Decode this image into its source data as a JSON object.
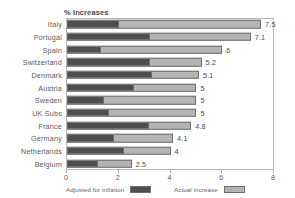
{
  "chart_data": {
    "type": "bar",
    "orientation": "horizontal",
    "stacked": true,
    "title": "% Increases",
    "xlabel": "",
    "ylabel": "",
    "xlim": [
      0,
      8
    ],
    "xticks": [
      "0",
      "2",
      "4",
      "6",
      "8"
    ],
    "grid": false,
    "legend_position": "bottom",
    "categories": [
      "Italy",
      "Portugal",
      "Spain",
      "Switzerland",
      "Denmark",
      "Austria",
      "Sweden",
      "UK Subs",
      "France",
      "Germany",
      "Netherlands",
      "Belgium"
    ],
    "series": [
      {
        "name": "Adjusted for inflation",
        "color": "#4e4e4e",
        "values": [
          2.0,
          3.2,
          1.3,
          3.2,
          3.3,
          2.6,
          1.4,
          1.6,
          3.2,
          1.8,
          2.2,
          1.2
        ]
      },
      {
        "name": "Actual increase",
        "color": "#b4b4b4",
        "values": [
          7.5,
          7.1,
          6,
          5.2,
          5.1,
          5,
          5,
          5,
          4.8,
          4.1,
          4,
          2.5
        ]
      }
    ],
    "data_labels": [
      "7.5",
      "7.1",
      "6",
      "5.2",
      "5.1",
      "5",
      "5",
      "5",
      "4.8",
      "4.1",
      "4",
      "2.5"
    ]
  },
  "legend": {
    "entries": [
      {
        "label": "Adjusted for inflation",
        "swatch": "dark"
      },
      {
        "label": "Actual increase",
        "swatch": "light"
      }
    ]
  }
}
